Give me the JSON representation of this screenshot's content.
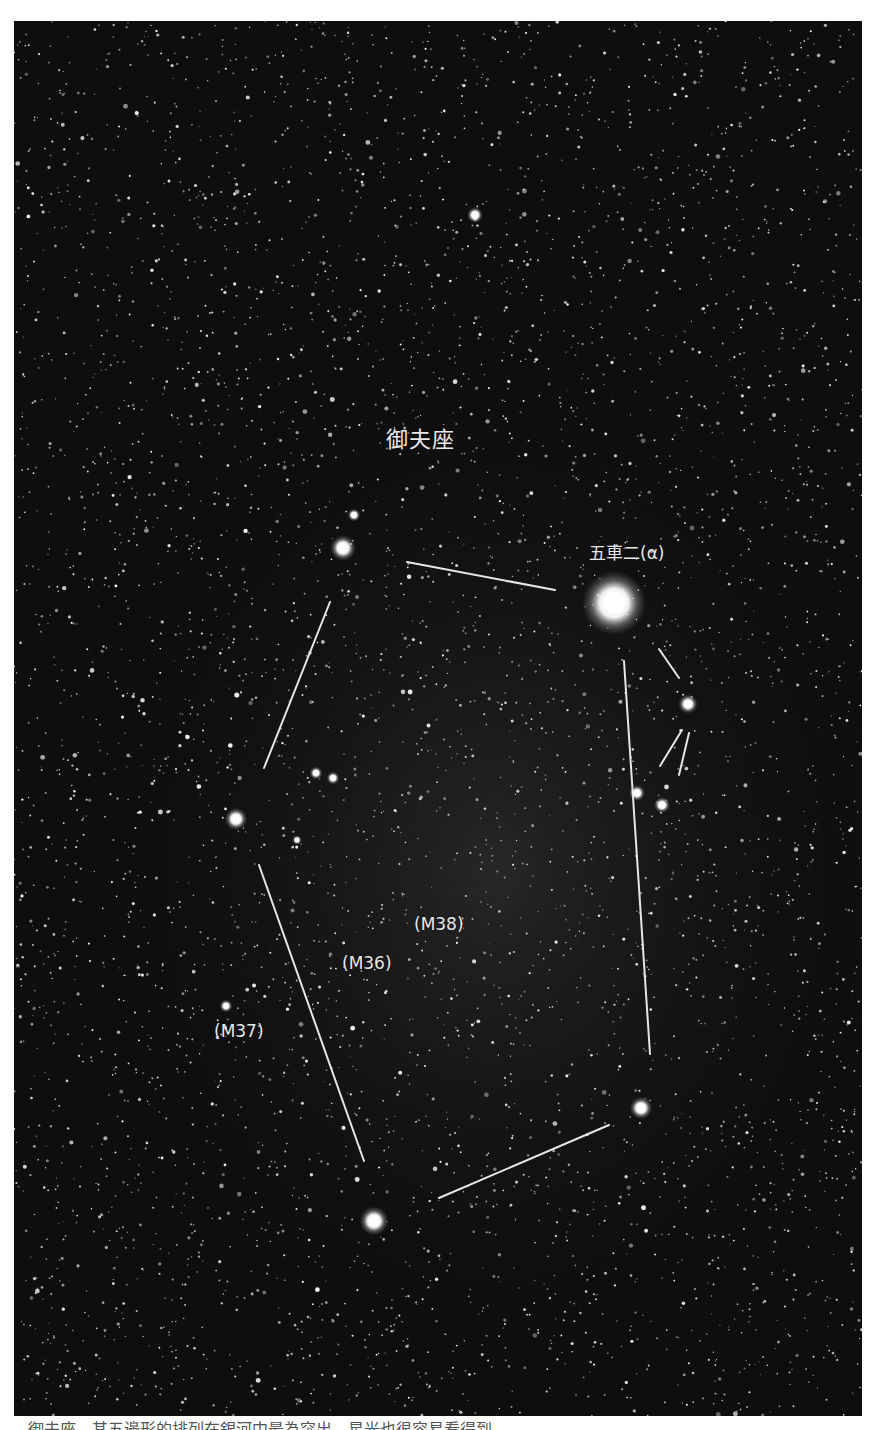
{
  "photo": {
    "background_color": "#0e0e0f",
    "line_color": "#e6e6e6",
    "labels": {
      "constellation": "御夫座",
      "alpha_star": "五車二(α)",
      "m38": "(M38)",
      "m36": "(M36)",
      "m37": "(M37)"
    },
    "bright_stars": [
      {
        "name": "capella",
        "x": 600,
        "y": 582,
        "r": 20
      },
      {
        "name": "menkalinan",
        "x": 329,
        "y": 527,
        "r": 8
      },
      {
        "name": "theta-aur",
        "x": 222,
        "y": 798,
        "r": 7
      },
      {
        "name": "elnath",
        "x": 360,
        "y": 1200,
        "r": 9
      },
      {
        "name": "iota-aur",
        "x": 627,
        "y": 1087,
        "r": 7
      },
      {
        "name": "epsilon-aur",
        "x": 674,
        "y": 683,
        "r": 6
      },
      {
        "name": "zeta-aur",
        "x": 623,
        "y": 772,
        "r": 5
      },
      {
        "name": "eta-aur",
        "x": 648,
        "y": 784,
        "r": 5
      },
      {
        "name": "star-top",
        "x": 461,
        "y": 194,
        "r": 5
      },
      {
        "name": "star-a",
        "x": 302,
        "y": 752,
        "r": 4
      },
      {
        "name": "star-b",
        "x": 319,
        "y": 757,
        "r": 4
      },
      {
        "name": "star-c",
        "x": 340,
        "y": 494,
        "r": 4
      },
      {
        "name": "star-d",
        "x": 283,
        "y": 819,
        "r": 3
      },
      {
        "name": "star-e",
        "x": 212,
        "y": 985,
        "r": 4
      }
    ],
    "lines": [
      {
        "x1": 393,
        "y1": 541,
        "x2": 541,
        "y2": 569
      },
      {
        "x1": 316,
        "y1": 581,
        "x2": 250,
        "y2": 747
      },
      {
        "x1": 245,
        "y1": 844,
        "x2": 350,
        "y2": 1140
      },
      {
        "x1": 425,
        "y1": 1177,
        "x2": 595,
        "y2": 1104
      },
      {
        "x1": 636,
        "y1": 1033,
        "x2": 610,
        "y2": 640
      },
      {
        "x1": 645,
        "y1": 628,
        "x2": 665,
        "y2": 657
      },
      {
        "x1": 668,
        "y1": 709,
        "x2": 646,
        "y2": 745
      },
      {
        "x1": 675,
        "y1": 712,
        "x2": 665,
        "y2": 754
      }
    ]
  },
  "caption": {
    "text": "御夫座，其五邊形的排列在銀河中最為突出，星光也很容易看得到。"
  }
}
